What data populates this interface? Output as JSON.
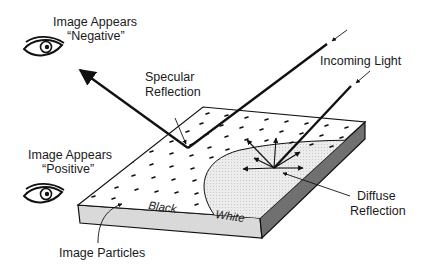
{
  "labels": {
    "negative_line1": "Image Appears",
    "negative_line2": "“Negative”",
    "positive_line1": "Image Appears",
    "positive_line2": "“Positive”",
    "specular_line1": "Specular",
    "specular_line2": "Reflection",
    "incoming_light": "Incoming Light",
    "diffuse_line1": "Diffuse",
    "diffuse_line2": "Reflection",
    "image_particles": "Image Particles",
    "black_region": "Black",
    "white_region": "White"
  },
  "icons": {
    "negative_viewer": "eye-icon",
    "positive_viewer": "eye-icon"
  },
  "colors": {
    "line": "#111111",
    "slab_top_black": "#ffffff",
    "slab_top_white": "#e6e6e6",
    "slab_front": "#d9d9d9",
    "slab_side": "#707070"
  }
}
